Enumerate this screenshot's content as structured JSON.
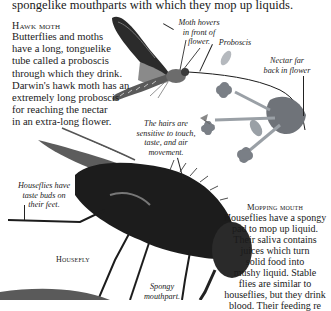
{
  "intro": {
    "line": "spongelike mouthparts with which they mop up liquids."
  },
  "hawk_moth": {
    "heading": "Hawk moth",
    "lines": [
      "Butterflies and moths",
      "have a long, tonguelike",
      "tube called a proboscis",
      "through which they drink.",
      "Darwin's hawk moth has an",
      "extremely long proboscis",
      "for reaching the nectar",
      "in an extra-long flower."
    ]
  },
  "captions": {
    "moth_hovers": [
      "Moth hovers",
      "in front of",
      "flower."
    ],
    "proboscis": [
      "Proboscis"
    ],
    "nectar": [
      "Nectar far",
      "back in flower"
    ],
    "hairs": [
      "The hairs are",
      "sensitive to touch,",
      "taste, and air",
      "movement."
    ],
    "taste_buds": [
      "Houseflies have",
      "taste buds on",
      "their feet."
    ],
    "spongy": [
      "Spongy",
      "mouthpart."
    ]
  },
  "housefly_label": "Housefly",
  "mopping": {
    "heading": "Mopping mouth",
    "lines": [
      "Houseflies have a spongy",
      "pad to mop up liquid.",
      "Their saliva contains",
      "juices which turn",
      "solid food into",
      "mushy liquid. Stable",
      "flies are similar to",
      "houseflies, but they drink",
      "blood. Their feeding re"
    ]
  },
  "colors": {
    "text": "#1a1a1a",
    "background": "#ffffff",
    "illustration_dark": "#1c1c1c",
    "illustration_mid": "#6b6b6b",
    "flower": "#7a7f86"
  }
}
